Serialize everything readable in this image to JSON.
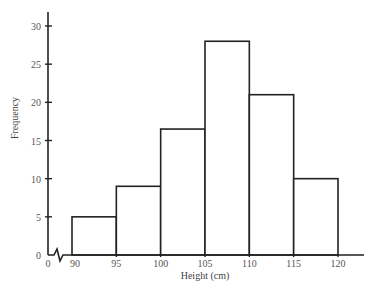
{
  "chart_data": {
    "type": "bar",
    "subtype": "histogram",
    "title": "",
    "xlabel": "Height (cm)",
    "ylabel": "Frequency",
    "bin_edges": [
      90,
      95,
      100,
      105,
      110,
      115,
      120
    ],
    "categories": [
      "90-95",
      "95-100",
      "100-105",
      "105-110",
      "110-115",
      "115-120"
    ],
    "values": [
      5,
      9,
      16.5,
      28,
      21,
      10
    ],
    "x_ticks": [
      "0",
      "90",
      "95",
      "100",
      "105",
      "110",
      "115",
      "120"
    ],
    "y_ticks": [
      "0",
      "5",
      "10",
      "15",
      "20",
      "25",
      "30"
    ],
    "ylim": [
      0,
      32
    ],
    "axis_break": "zigzag between 0 and 90 on x-axis",
    "grid": false,
    "legend": null,
    "colors": {
      "line": "#222222",
      "fill": "#ffffff"
    }
  }
}
